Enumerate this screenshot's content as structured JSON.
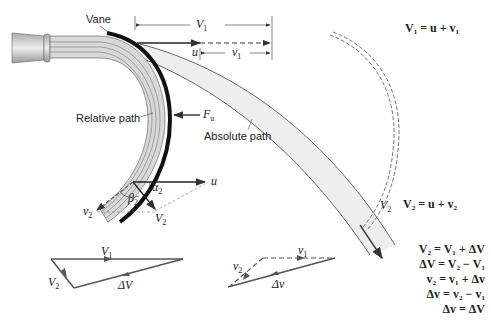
{
  "labels": {
    "vane": "Vane",
    "relative_path": "Relative path",
    "absolute_path": "Absolute path"
  },
  "symbols": {
    "V1_top": "V",
    "V1_top_sub": "1",
    "u_top": "u",
    "v1_top": "v",
    "v1_top_sub": "1",
    "Fu": "F",
    "Fu_sub": "u",
    "u_outlet": "u",
    "alpha2": "α",
    "alpha2_sub": "2",
    "beta2": "β",
    "beta2_sub": "2",
    "v2_outlet": "v",
    "v2_outlet_sub": "2",
    "V2_outlet": "V",
    "V2_outlet_sub": "2",
    "V2_abs": "V",
    "V2_abs_sub": "2",
    "tri1_V1": "V",
    "tri1_V1_sub": "1",
    "tri1_V2": "V",
    "tri1_V2_sub": "2",
    "tri1_dV": "ΔV",
    "tri2_v1": "v",
    "tri2_v1_sub": "1",
    "tri2_v2": "v",
    "tri2_v2_sub": "2",
    "tri2_dv": "Δv"
  },
  "equations": {
    "eq_V1": "V₁ = u + v₁",
    "eq_V2": "V₂ = u + v₂",
    "list": [
      "V₂ = V₁ + ΔV",
      "ΔV = V₂ − V₁",
      "v₂ = v₁ + Δv",
      "Δv = v₂ − v₁",
      "Δv = ΔV"
    ]
  },
  "colors": {
    "line": "#333333",
    "vane": "#111111",
    "jet_fill": "#d8d8d8",
    "absolute_fill": "#eeeeee",
    "dashed": "#666666"
  }
}
